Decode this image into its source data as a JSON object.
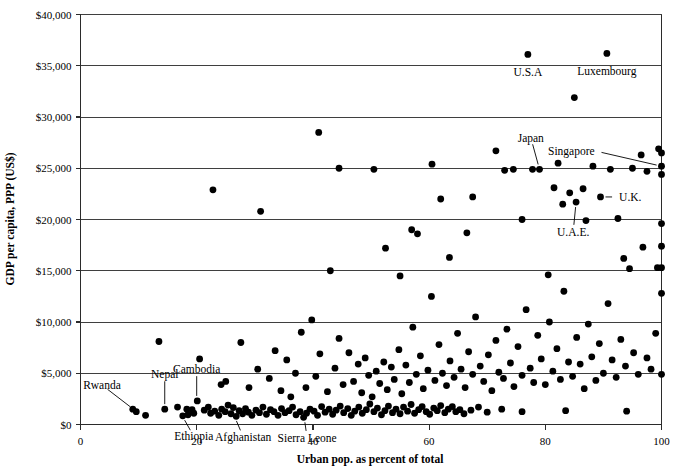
{
  "chart_data": {
    "type": "scatter",
    "title": "",
    "xlabel": "Urban pop. as percent of total",
    "ylabel": "GDP per capita, PPP (US$)",
    "xlim": [
      0,
      100
    ],
    "ylim": [
      0,
      40000
    ],
    "xticks": [
      0,
      20,
      40,
      60,
      80,
      100
    ],
    "xtick_labels": [
      "0",
      "20",
      "40",
      "60",
      "80",
      "100"
    ],
    "yticks": [
      0,
      5000,
      10000,
      15000,
      20000,
      25000,
      30000,
      35000,
      40000
    ],
    "ytick_labels": [
      "$0",
      "$5,000",
      "$10,000",
      "$15,000",
      "$20,000",
      "$25,000",
      "$30,000",
      "$35,000",
      "$40,000"
    ],
    "grid": "horizontal",
    "legend": "none",
    "marker": {
      "shape": "circle",
      "color": "#000000",
      "size": 6.6
    },
    "annotations": [
      {
        "label": "U.S.A",
        "x": 77.0,
        "y": 36100,
        "text_dx": 0,
        "text_dy": -1700,
        "anchor": "middle",
        "leader": false
      },
      {
        "label": "Luxembourg",
        "x": 90.6,
        "y": 36200,
        "text_dx": 0,
        "text_dy": -1700,
        "anchor": "middle",
        "leader": false
      },
      {
        "label": "Japan",
        "x": 79.0,
        "y": 24900,
        "text_dx": -1.5,
        "text_dy": 3100,
        "anchor": "middle",
        "leader": true
      },
      {
        "label": "Singapore",
        "x": 100.0,
        "y": 25200,
        "text_dx": -11.5,
        "text_dy": 1500,
        "anchor": "end",
        "leader": true
      },
      {
        "label": "U.K.",
        "x": 89.5,
        "y": 22200,
        "text_dx": 3.2,
        "text_dy": 0,
        "anchor": "start",
        "leader": true
      },
      {
        "label": "U.A.E.",
        "x": 85.3,
        "y": 21700,
        "text_dx": -0.5,
        "text_dy": -2900,
        "anchor": "middle",
        "leader": true
      },
      {
        "label": "Rwanda",
        "x": 9.2,
        "y": 1450,
        "text_dx": -5.5,
        "text_dy": 2400,
        "anchor": "middle",
        "leader": true
      },
      {
        "label": "Nepal",
        "x": 14.5,
        "y": 1500,
        "text_dx": 0,
        "text_dy": 3400,
        "anchor": "middle",
        "leader": true
      },
      {
        "label": "Cambodia",
        "x": 20.0,
        "y": 2300,
        "text_dx": 0,
        "text_dy": 3100,
        "anchor": "middle",
        "leader": true
      },
      {
        "label": "Ethiopia",
        "x": 17.5,
        "y": 850,
        "text_dx": 2.0,
        "text_dy": -2000,
        "anchor": "middle",
        "leader": true
      },
      {
        "label": "Afghanistan",
        "x": 26.5,
        "y": 800,
        "text_dx": 1.5,
        "text_dy": -2000,
        "anchor": "middle",
        "leader": true
      },
      {
        "label": "Sierra Leone",
        "x": 38.5,
        "y": 700,
        "text_dx": 0.5,
        "text_dy": -2000,
        "anchor": "middle",
        "leader": true
      }
    ],
    "points": [
      [
        9.0,
        1500
      ],
      [
        9.6,
        1250
      ],
      [
        11.2,
        900
      ],
      [
        14.5,
        1500
      ],
      [
        16.7,
        1700
      ],
      [
        18.3,
        1500
      ],
      [
        19.2,
        1450
      ],
      [
        17.6,
        850
      ],
      [
        18.5,
        950
      ],
      [
        19.5,
        1100
      ],
      [
        20.1,
        2300
      ],
      [
        21.3,
        1400
      ],
      [
        22.0,
        1700
      ],
      [
        22.4,
        1100
      ],
      [
        23.1,
        1300
      ],
      [
        23.8,
        900
      ],
      [
        24.3,
        1500
      ],
      [
        24.9,
        1250
      ],
      [
        25.4,
        1900
      ],
      [
        25.9,
        1050
      ],
      [
        26.3,
        1650
      ],
      [
        26.8,
        800
      ],
      [
        27.3,
        1350
      ],
      [
        27.9,
        1050
      ],
      [
        28.4,
        1550
      ],
      [
        28.9,
        1200
      ],
      [
        29.5,
        900
      ],
      [
        30.2,
        1400
      ],
      [
        30.8,
        1150
      ],
      [
        31.4,
        1700
      ],
      [
        32.0,
        1000
      ],
      [
        32.7,
        1450
      ],
      [
        33.3,
        1250
      ],
      [
        34.0,
        900
      ],
      [
        34.6,
        1550
      ],
      [
        35.2,
        1150
      ],
      [
        35.9,
        1350
      ],
      [
        36.5,
        1700
      ],
      [
        37.1,
        950
      ],
      [
        37.8,
        1250
      ],
      [
        38.4,
        700
      ],
      [
        38.9,
        1100
      ],
      [
        39.5,
        1500
      ],
      [
        40.2,
        1300
      ],
      [
        40.8,
        900
      ],
      [
        41.5,
        1750
      ],
      [
        42.1,
        1200
      ],
      [
        42.8,
        1500
      ],
      [
        43.4,
        1000
      ],
      [
        44.0,
        1400
      ],
      [
        44.7,
        1800
      ],
      [
        45.3,
        1150
      ],
      [
        46.0,
        1550
      ],
      [
        46.6,
        900
      ],
      [
        47.2,
        1300
      ],
      [
        47.9,
        1700
      ],
      [
        48.5,
        1100
      ],
      [
        49.2,
        1450
      ],
      [
        49.8,
        2000
      ],
      [
        50.5,
        1250
      ],
      [
        51.1,
        1600
      ],
      [
        51.8,
        950
      ],
      [
        52.4,
        1350
      ],
      [
        53.0,
        1800
      ],
      [
        53.7,
        1150
      ],
      [
        54.3,
        1500
      ],
      [
        55.0,
        1050
      ],
      [
        55.6,
        1700
      ],
      [
        56.3,
        1300
      ],
      [
        56.9,
        1950
      ],
      [
        57.5,
        1100
      ],
      [
        58.2,
        1450
      ],
      [
        58.8,
        1750
      ],
      [
        59.5,
        1250
      ],
      [
        60.1,
        1000
      ],
      [
        60.8,
        1600
      ],
      [
        61.4,
        1350
      ],
      [
        62.0,
        1850
      ],
      [
        62.7,
        1150
      ],
      [
        63.3,
        1500
      ],
      [
        64.0,
        1750
      ],
      [
        64.6,
        1250
      ],
      [
        65.3,
        1450
      ],
      [
        66.0,
        1050
      ],
      [
        67.2,
        1400
      ],
      [
        68.5,
        1700
      ],
      [
        70.0,
        1200
      ],
      [
        72.5,
        1500
      ],
      [
        76.0,
        1250
      ],
      [
        83.5,
        1350
      ],
      [
        94.0,
        1300
      ],
      [
        13.5,
        8100
      ],
      [
        22.8,
        22900
      ],
      [
        20.5,
        6400
      ],
      [
        24.2,
        3900
      ],
      [
        25.0,
        4200
      ],
      [
        27.6,
        8000
      ],
      [
        29.0,
        3600
      ],
      [
        31.0,
        20800
      ],
      [
        30.5,
        5400
      ],
      [
        32.5,
        4500
      ],
      [
        33.5,
        7200
      ],
      [
        34.5,
        3300
      ],
      [
        35.5,
        6300
      ],
      [
        36.2,
        2700
      ],
      [
        37.0,
        5000
      ],
      [
        38.0,
        9000
      ],
      [
        38.8,
        3600
      ],
      [
        39.8,
        10200
      ],
      [
        40.5,
        4700
      ],
      [
        41.2,
        6900
      ],
      [
        42.5,
        3200
      ],
      [
        43.0,
        15000
      ],
      [
        43.8,
        5500
      ],
      [
        44.5,
        8400
      ],
      [
        45.2,
        3900
      ],
      [
        46.2,
        7000
      ],
      [
        47.0,
        4200
      ],
      [
        47.8,
        5900
      ],
      [
        48.4,
        3100
      ],
      [
        49.0,
        6500
      ],
      [
        49.6,
        4800
      ],
      [
        50.2,
        2700
      ],
      [
        50.9,
        5200
      ],
      [
        51.5,
        4000
      ],
      [
        52.2,
        6100
      ],
      [
        52.8,
        3400
      ],
      [
        53.5,
        5600
      ],
      [
        54.0,
        4400
      ],
      [
        54.8,
        7300
      ],
      [
        55.3,
        3000
      ],
      [
        56.0,
        5800
      ],
      [
        56.6,
        4100
      ],
      [
        57.2,
        9500
      ],
      [
        57.8,
        4900
      ],
      [
        58.5,
        6700
      ],
      [
        59.0,
        3500
      ],
      [
        59.8,
        5300
      ],
      [
        60.4,
        12500
      ],
      [
        61.0,
        4300
      ],
      [
        61.7,
        7800
      ],
      [
        62.3,
        5000
      ],
      [
        63.0,
        3800
      ],
      [
        63.6,
        6200
      ],
      [
        64.3,
        4600
      ],
      [
        64.9,
        8900
      ],
      [
        65.5,
        5400
      ],
      [
        66.2,
        3600
      ],
      [
        66.8,
        7100
      ],
      [
        67.5,
        4900
      ],
      [
        68.0,
        10500
      ],
      [
        68.8,
        5700
      ],
      [
        69.4,
        4200
      ],
      [
        70.2,
        6800
      ],
      [
        70.8,
        3300
      ],
      [
        71.5,
        8200
      ],
      [
        72.0,
        5100
      ],
      [
        72.8,
        4500
      ],
      [
        73.4,
        9300
      ],
      [
        74.0,
        6000
      ],
      [
        74.6,
        3700
      ],
      [
        75.3,
        7600
      ],
      [
        76.0,
        4800
      ],
      [
        76.7,
        11200
      ],
      [
        77.4,
        5500
      ],
      [
        78.0,
        4100
      ],
      [
        78.7,
        8700
      ],
      [
        79.3,
        6400
      ],
      [
        80.0,
        3900
      ],
      [
        80.7,
        10000
      ],
      [
        81.3,
        5200
      ],
      [
        82.0,
        7400
      ],
      [
        82.6,
        4400
      ],
      [
        83.2,
        13000
      ],
      [
        84.0,
        6100
      ],
      [
        84.7,
        4700
      ],
      [
        85.4,
        8500
      ],
      [
        86.0,
        5900
      ],
      [
        86.7,
        3500
      ],
      [
        87.4,
        9800
      ],
      [
        88.0,
        6600
      ],
      [
        88.7,
        4300
      ],
      [
        89.3,
        7900
      ],
      [
        90.0,
        5000
      ],
      [
        90.8,
        11800
      ],
      [
        91.5,
        6300
      ],
      [
        92.2,
        4600
      ],
      [
        93.0,
        8300
      ],
      [
        93.8,
        5700
      ],
      [
        94.5,
        15200
      ],
      [
        95.2,
        7000
      ],
      [
        96.0,
        4900
      ],
      [
        96.8,
        17300
      ],
      [
        97.5,
        6500
      ],
      [
        98.2,
        5400
      ],
      [
        99.0,
        8900
      ],
      [
        100.0,
        4900
      ],
      [
        100.0,
        17400
      ],
      [
        100.0,
        15300
      ],
      [
        99.3,
        15300
      ],
      [
        41.0,
        28500
      ],
      [
        44.5,
        25000
      ],
      [
        50.5,
        24900
      ],
      [
        52.5,
        17200
      ],
      [
        55.0,
        14500
      ],
      [
        57.0,
        19000
      ],
      [
        58.0,
        18600
      ],
      [
        60.5,
        25400
      ],
      [
        62.0,
        22000
      ],
      [
        63.5,
        16300
      ],
      [
        66.5,
        18700
      ],
      [
        67.5,
        22200
      ],
      [
        71.5,
        26700
      ],
      [
        73.0,
        24800
      ],
      [
        74.5,
        24900
      ],
      [
        76.0,
        20000
      ],
      [
        77.0,
        36100
      ],
      [
        77.8,
        24900
      ],
      [
        79.0,
        24900
      ],
      [
        80.5,
        14600
      ],
      [
        81.5,
        23100
      ],
      [
        82.2,
        25500
      ],
      [
        83.0,
        21500
      ],
      [
        84.2,
        22600
      ],
      [
        85.3,
        21700
      ],
      [
        85.0,
        31900
      ],
      [
        86.5,
        23000
      ],
      [
        87.0,
        19900
      ],
      [
        88.2,
        25200
      ],
      [
        89.5,
        22200
      ],
      [
        90.6,
        36200
      ],
      [
        91.2,
        24900
      ],
      [
        92.5,
        20100
      ],
      [
        93.5,
        16200
      ],
      [
        95.0,
        25000
      ],
      [
        96.5,
        26300
      ],
      [
        97.5,
        24700
      ],
      [
        99.5,
        26900
      ],
      [
        100.0,
        26500
      ],
      [
        100.0,
        25200
      ],
      [
        100.0,
        24400
      ],
      [
        100.0,
        19600
      ],
      [
        100.0,
        12800
      ]
    ]
  },
  "axes": {
    "x_axis_name": "urban-population-percent-axis",
    "y_axis_name": "gdp-per-capita-axis"
  }
}
